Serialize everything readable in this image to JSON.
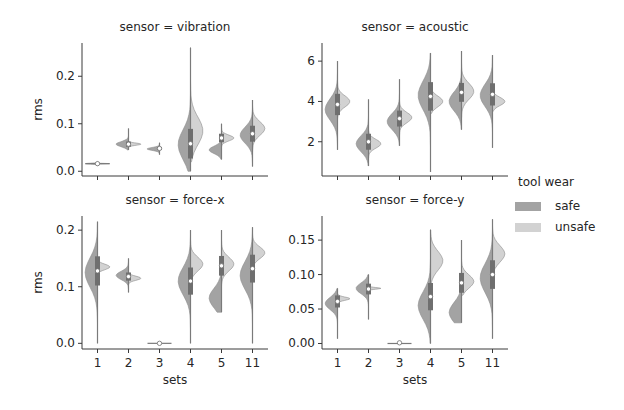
{
  "figure": {
    "legend": {
      "title": "tool wear",
      "items": [
        {
          "label": "safe",
          "color": "#a3a3a3"
        },
        {
          "label": "unsafe",
          "color": "#d2d2d2"
        }
      ]
    }
  },
  "chart_data": [
    {
      "type": "violin",
      "title": "sensor = vibration",
      "xlabel": "",
      "ylabel": "rms",
      "categories": [
        "1",
        "2",
        "3",
        "4",
        "5",
        "11"
      ],
      "yticks": [
        0.0,
        0.1,
        0.2
      ],
      "ytick_labels": [
        "0.0",
        "0.1",
        "0.2"
      ],
      "ylim": [
        -0.01,
        0.27
      ],
      "split_by": "tool wear",
      "series": [
        {
          "name": "safe",
          "median": [
            0.016,
            0.057,
            0.047,
            0.056,
            0.045,
            0.076
          ],
          "min": [
            0.012,
            0.045,
            0.035,
            0.0,
            0.025,
            0.01
          ],
          "max": [
            0.02,
            0.09,
            0.06,
            0.26,
            0.09,
            0.15
          ]
        },
        {
          "name": "unsafe",
          "median": [
            0.016,
            0.057,
            0.05,
            0.085,
            0.07,
            0.09
          ],
          "min": [
            0.014,
            0.05,
            0.05,
            0.02,
            0.05,
            0.03
          ],
          "max": [
            0.018,
            0.07,
            0.05,
            0.26,
            0.1,
            0.15
          ]
        }
      ],
      "center_marker": [
        0.016,
        0.057,
        0.048,
        0.058,
        0.07,
        0.079
      ]
    },
    {
      "type": "violin",
      "title": "sensor = acoustic",
      "xlabel": "",
      "ylabel": "",
      "categories": [
        "1",
        "2",
        "3",
        "4",
        "5",
        "11"
      ],
      "yticks": [
        2,
        4,
        6
      ],
      "ytick_labels": [
        "2",
        "4",
        "6"
      ],
      "ylim": [
        0.3,
        6.9
      ],
      "split_by": "tool wear",
      "series": [
        {
          "name": "safe",
          "median": [
            3.6,
            1.9,
            3.0,
            4.3,
            4.0,
            4.3
          ],
          "min": [
            1.6,
            0.8,
            1.8,
            0.5,
            2.6,
            1.7
          ],
          "max": [
            6.0,
            4.1,
            5.1,
            6.4,
            6.5,
            6.3
          ]
        },
        {
          "name": "unsafe",
          "median": [
            4.0,
            1.9,
            3.2,
            4.0,
            4.5,
            4.0
          ],
          "min": [
            2.7,
            1.2,
            2.3,
            3.4,
            3.2,
            3.5
          ],
          "max": [
            5.0,
            3.0,
            4.4,
            5.6,
            6.5,
            5.2
          ]
        }
      ],
      "center_marker": [
        3.85,
        2.0,
        3.15,
        4.25,
        4.45,
        4.35
      ]
    },
    {
      "type": "violin",
      "title": "sensor = force-x",
      "xlabel": "sets",
      "ylabel": "rms",
      "categories": [
        "1",
        "2",
        "3",
        "4",
        "5",
        "11"
      ],
      "yticks": [
        0.0,
        0.1,
        0.2
      ],
      "ytick_labels": [
        "0.0",
        "0.1",
        "0.2"
      ],
      "ylim": [
        -0.01,
        0.225
      ],
      "split_by": "tool wear",
      "series": [
        {
          "name": "safe",
          "median": [
            0.125,
            0.12,
            0.0,
            0.11,
            0.08,
            0.12
          ],
          "min": [
            0.0,
            0.09,
            0.0,
            0.0,
            0.055,
            0.0
          ],
          "max": [
            0.215,
            0.15,
            0.0,
            0.2,
            0.2,
            0.205
          ]
        },
        {
          "name": "unsafe",
          "median": [
            0.135,
            0.115,
            0.0,
            0.14,
            0.14,
            0.16
          ],
          "min": [
            0.11,
            0.1,
            0.0,
            0.1,
            0.1,
            0.12
          ],
          "max": [
            0.15,
            0.13,
            0.0,
            0.2,
            0.2,
            0.205
          ]
        }
      ],
      "center_marker": [
        0.128,
        0.118,
        0.0,
        0.11,
        0.137,
        0.132
      ]
    },
    {
      "type": "violin",
      "title": "sensor = force-y",
      "xlabel": "sets",
      "ylabel": "",
      "categories": [
        "1",
        "2",
        "3",
        "4",
        "5",
        "11"
      ],
      "yticks": [
        0.0,
        0.05,
        0.1,
        0.15
      ],
      "ytick_labels": [
        "0.00",
        "0.05",
        "0.10",
        "0.15"
      ],
      "ylim": [
        -0.008,
        0.185
      ],
      "split_by": "tool wear",
      "series": [
        {
          "name": "safe",
          "median": [
            0.058,
            0.08,
            0.0,
            0.055,
            0.045,
            0.095
          ],
          "min": [
            0.007,
            0.035,
            0.0,
            0.0,
            0.03,
            0.007
          ],
          "max": [
            0.08,
            0.1,
            0.0,
            0.165,
            0.15,
            0.18
          ]
        },
        {
          "name": "unsafe",
          "median": [
            0.065,
            0.08,
            0.0,
            0.12,
            0.09,
            0.13
          ],
          "min": [
            0.055,
            0.075,
            0.0,
            0.05,
            0.07,
            0.08
          ],
          "max": [
            0.075,
            0.085,
            0.0,
            0.165,
            0.15,
            0.18
          ]
        }
      ],
      "center_marker": [
        0.061,
        0.079,
        0.001,
        0.068,
        0.088,
        0.1
      ]
    }
  ]
}
